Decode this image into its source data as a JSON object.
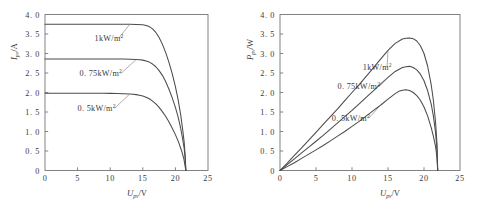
{
  "figure": {
    "title": "",
    "panels": [
      "iv-curve",
      "pv-curve"
    ]
  },
  "chart_data": [
    {
      "id": "iv-curve",
      "type": "line",
      "title": "",
      "xlabel": "U_pv/V",
      "xlabel_main": "U",
      "xlabel_sub": "pv",
      "xlabel_unit": "/V",
      "ylabel": "I_pv/A",
      "ylabel_main": "I",
      "ylabel_sub": "pv",
      "ylabel_unit": "/A",
      "xlim": [
        0,
        25
      ],
      "ylim": [
        0,
        4.0
      ],
      "xticks": [
        0,
        5,
        10,
        15,
        20,
        25
      ],
      "xticklabels": [
        "0",
        "5",
        "10",
        "15",
        "20",
        "25"
      ],
      "yticks": [
        0,
        0.5,
        1.0,
        1.5,
        2.0,
        2.5,
        3.0,
        3.5,
        4.0
      ],
      "yticklabels": [
        "0",
        "0. 5",
        "1. 0",
        "1. 5",
        "2. 0",
        "2. 5",
        "3. 0",
        "3. 5",
        "4. 0"
      ],
      "grid": false,
      "legend_position": "inline-annotations",
      "series": [
        {
          "name": "1kW/m2",
          "label_main": "1kW/m",
          "label_sup": "2",
          "isc": 3.75,
          "voc": 21.6,
          "x": [
            0,
            1,
            2,
            3,
            4,
            5,
            6,
            7,
            8,
            9,
            10,
            11,
            12,
            13,
            14,
            15,
            15.5,
            16,
            16.5,
            17,
            17.5,
            18,
            18.5,
            19,
            19.5,
            20,
            20.4,
            20.8,
            21.1,
            21.35,
            21.5,
            21.6
          ],
          "y": [
            3.75,
            3.75,
            3.75,
            3.75,
            3.75,
            3.75,
            3.75,
            3.75,
            3.75,
            3.75,
            3.75,
            3.75,
            3.749,
            3.748,
            3.745,
            3.735,
            3.72,
            3.69,
            3.63,
            3.54,
            3.41,
            3.24,
            3.03,
            2.78,
            2.49,
            2.15,
            1.83,
            1.44,
            1.07,
            0.72,
            0.38,
            0.0
          ],
          "annotation": {
            "text": "1kW/m2",
            "x": 7.6,
            "y": 3.33
          }
        },
        {
          "name": "0.75kW/m2",
          "label_main": "0. 75kW/m",
          "label_sup": "2",
          "isc": 2.86,
          "voc": 21.6,
          "x": [
            0,
            1,
            2,
            3,
            4,
            5,
            6,
            7,
            8,
            9,
            10,
            11,
            12,
            13,
            14,
            14.5,
            15,
            15.5,
            16,
            16.5,
            17,
            17.5,
            18,
            18.5,
            19,
            19.5,
            20,
            20.4,
            20.8,
            21.1,
            21.35,
            21.5,
            21.6
          ],
          "y": [
            2.86,
            2.86,
            2.86,
            2.86,
            2.86,
            2.86,
            2.86,
            2.86,
            2.86,
            2.86,
            2.86,
            2.859,
            2.858,
            2.855,
            2.847,
            2.84,
            2.83,
            2.81,
            2.78,
            2.73,
            2.66,
            2.56,
            2.44,
            2.28,
            2.09,
            1.87,
            1.62,
            1.38,
            1.09,
            0.82,
            0.56,
            0.3,
            0.0
          ],
          "annotation": {
            "text": "0.75kW/m2",
            "x": 5.3,
            "y": 2.42
          }
        },
        {
          "name": "0.5kW/m2",
          "label_main": "0. 5kW/m",
          "label_sup": "2",
          "isc": 1.98,
          "voc": 21.6,
          "x": [
            0,
            1,
            2,
            3,
            4,
            5,
            6,
            7,
            8,
            9,
            10,
            11,
            12,
            13,
            13.5,
            14,
            14.5,
            15,
            15.5,
            16,
            16.5,
            17,
            17.5,
            18,
            18.5,
            19,
            19.5,
            20,
            20.5,
            21,
            21.3,
            21.6
          ],
          "y": [
            1.98,
            1.98,
            1.98,
            1.98,
            1.98,
            1.98,
            1.98,
            1.98,
            1.98,
            1.979,
            1.978,
            1.975,
            1.97,
            1.962,
            1.955,
            1.945,
            1.93,
            1.91,
            1.88,
            1.84,
            1.78,
            1.71,
            1.62,
            1.51,
            1.39,
            1.25,
            1.09,
            0.92,
            0.72,
            0.48,
            0.3,
            0.0
          ],
          "annotation": {
            "text": "0.5kW/m2",
            "x": 5.0,
            "y": 1.53
          }
        }
      ]
    },
    {
      "id": "pv-curve",
      "type": "line",
      "title": "",
      "xlabel": "U_pv/V",
      "xlabel_main": "U",
      "xlabel_sub": "pv",
      "xlabel_unit": "/V",
      "ylabel": "P_pv/W",
      "ylabel_main": "P",
      "ylabel_sub": "pv",
      "ylabel_unit": "/W",
      "xlim": [
        0,
        25
      ],
      "ylim": [
        0,
        4.0
      ],
      "xticks": [
        0,
        5,
        10,
        15,
        20,
        25
      ],
      "xticklabels": [
        "0",
        "5",
        "10",
        "15",
        "20",
        "25"
      ],
      "yticks": [
        0,
        0.5,
        1.0,
        1.5,
        2.0,
        2.5,
        3.0,
        3.5,
        4.0
      ],
      "yticklabels": [
        "0",
        "0. 5",
        "1. 0",
        "1. 5",
        "2. 0",
        "2. 5",
        "3. 0",
        "3. 5",
        "4. 0"
      ],
      "grid": false,
      "legend_position": "inline-annotations",
      "series": [
        {
          "name": "1kW/m2",
          "label_main": "1kW/m",
          "label_sup": "2",
          "pmax": 3.4,
          "vmp": 18.6,
          "voc": 21.9,
          "x": [
            0,
            1,
            2,
            3,
            4,
            5,
            6,
            7,
            8,
            9,
            10,
            11,
            12,
            13,
            14,
            15,
            16,
            17,
            17.5,
            18,
            18.5,
            19,
            19.5,
            20,
            20.5,
            21,
            21.3,
            21.6,
            21.8,
            21.9
          ],
          "y": [
            0,
            0.19,
            0.39,
            0.58,
            0.78,
            0.98,
            1.18,
            1.38,
            1.58,
            1.79,
            2.0,
            2.2,
            2.42,
            2.64,
            2.86,
            3.08,
            3.26,
            3.37,
            3.39,
            3.4,
            3.38,
            3.32,
            3.2,
            3.0,
            2.68,
            2.2,
            1.8,
            1.25,
            0.7,
            0.0
          ],
          "annotation": {
            "text": "1kW/m2",
            "x": 11.5,
            "y": 2.58
          }
        },
        {
          "name": "0.75kW/m2",
          "label_main": "0. 75kW/m",
          "label_sup": "2",
          "pmax": 2.67,
          "vmp": 18.0,
          "voc": 21.9,
          "x": [
            0,
            1,
            2,
            3,
            4,
            5,
            6,
            7,
            8,
            9,
            10,
            11,
            12,
            13,
            14,
            15,
            16,
            17,
            17.5,
            18,
            18.5,
            19,
            19.5,
            20,
            20.5,
            21,
            21.3,
            21.6,
            21.8,
            21.9
          ],
          "y": [
            0,
            0.15,
            0.3,
            0.45,
            0.6,
            0.75,
            0.9,
            1.06,
            1.22,
            1.38,
            1.54,
            1.71,
            1.88,
            2.05,
            2.22,
            2.39,
            2.54,
            2.64,
            2.66,
            2.67,
            2.64,
            2.58,
            2.47,
            2.3,
            2.05,
            1.7,
            1.4,
            0.98,
            0.55,
            0.0
          ],
          "annotation": {
            "text": "0.75kW/m2",
            "x": 8.0,
            "y": 2.08
          }
        },
        {
          "name": "0.5kW/m2",
          "label_main": "0. 5kW/m",
          "label_sup": "2",
          "pmax": 2.07,
          "vmp": 17.0,
          "voc": 21.9,
          "x": [
            0,
            1,
            2,
            3,
            4,
            5,
            6,
            7,
            8,
            9,
            10,
            11,
            12,
            13,
            14,
            15,
            16,
            16.5,
            17,
            17.5,
            18,
            18.5,
            19,
            19.5,
            20,
            20.5,
            21,
            21.3,
            21.6,
            21.8,
            21.9
          ],
          "y": [
            0,
            0.1,
            0.2,
            0.31,
            0.42,
            0.53,
            0.64,
            0.76,
            0.88,
            1.0,
            1.13,
            1.26,
            1.4,
            1.54,
            1.68,
            1.83,
            1.97,
            2.03,
            2.06,
            2.07,
            2.05,
            2.0,
            1.92,
            1.8,
            1.63,
            1.4,
            1.1,
            0.88,
            0.62,
            0.34,
            0.0
          ],
          "annotation": {
            "text": "0.5kW/m2",
            "x": 7.2,
            "y": 1.28
          }
        }
      ]
    }
  ]
}
